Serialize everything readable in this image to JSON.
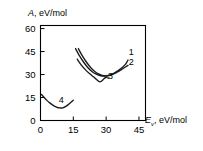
{
  "chart_data": {
    "type": "line",
    "title": "",
    "subtitle": "",
    "xlabel_symbol": "E",
    "xlabel_subscript": "v",
    "xlabel_units": ", eV/mol",
    "ylabel_symbol": "A",
    "ylabel_units": ", eV/mol",
    "xlim": [
      0,
      48
    ],
    "ylim": [
      0,
      62
    ],
    "xticks": [
      0,
      15,
      30,
      45
    ],
    "yticks": [
      0,
      15,
      30,
      45,
      60
    ],
    "xtick_labels": [
      "0",
      "15",
      "30",
      "45"
    ],
    "ytick_labels": [
      "0",
      "15",
      "30",
      "45",
      "60"
    ],
    "grid": false,
    "legend_position": "inline-curve-labels",
    "series": [
      {
        "name": "1",
        "label": "1",
        "label_x": 41.5,
        "label_y": 42.5,
        "points": [
          [
            16.0,
            47.0
          ],
          [
            17.5,
            43.0
          ],
          [
            19.5,
            38.5
          ],
          [
            21.5,
            34.8
          ],
          [
            23.5,
            32.0
          ],
          [
            25.5,
            30.2
          ],
          [
            27.5,
            29.2
          ],
          [
            29.5,
            29.0
          ],
          [
            31.5,
            29.6
          ],
          [
            33.5,
            30.8
          ],
          [
            35.5,
            32.6
          ],
          [
            37.5,
            34.8
          ],
          [
            39.0,
            37.0
          ],
          [
            40.0,
            39.5
          ]
        ]
      },
      {
        "name": "2",
        "label": "2",
        "label_x": 41.5,
        "label_y": 36.5,
        "points": [
          [
            17.3,
            47.0
          ],
          [
            18.8,
            43.0
          ],
          [
            20.8,
            38.5
          ],
          [
            22.8,
            34.8
          ],
          [
            24.8,
            32.0
          ],
          [
            26.8,
            30.2
          ],
          [
            28.8,
            29.2
          ],
          [
            30.8,
            29.2
          ],
          [
            32.8,
            30.0
          ],
          [
            34.8,
            31.4
          ],
          [
            36.8,
            33.0
          ],
          [
            38.5,
            34.6
          ],
          [
            40.0,
            36.0
          ]
        ]
      },
      {
        "name": "3",
        "label": "3",
        "label_x": 32.0,
        "label_y": 27.0,
        "points": [
          [
            16.8,
            40.0
          ],
          [
            18.5,
            36.5
          ],
          [
            20.5,
            33.2
          ],
          [
            22.5,
            30.5
          ],
          [
            24.5,
            28.2
          ],
          [
            26.0,
            26.2
          ],
          [
            27.0,
            25.2
          ],
          [
            28.0,
            25.8
          ],
          [
            29.0,
            27.2
          ],
          [
            30.0,
            28.3
          ]
        ]
      },
      {
        "name": "4",
        "label": "4",
        "label_x": 9.5,
        "label_y": 11.5,
        "points": [
          [
            0.5,
            17.0
          ],
          [
            1.5,
            15.3
          ],
          [
            2.8,
            13.3
          ],
          [
            4.2,
            11.5
          ],
          [
            5.8,
            9.9
          ],
          [
            7.3,
            8.8
          ],
          [
            8.8,
            8.2
          ],
          [
            10.2,
            8.3
          ],
          [
            11.6,
            9.2
          ],
          [
            13.0,
            10.7
          ],
          [
            14.2,
            12.2
          ],
          [
            15.0,
            13.3
          ]
        ]
      }
    ],
    "curve_3_pointer": {
      "from": [
        30.0,
        28.3
      ],
      "to": [
        31.3,
        27.4
      ]
    },
    "colors": {
      "axis": "#000000",
      "curve": "#1a1a1a",
      "text": "#000000",
      "background": "#ffffff"
    }
  }
}
